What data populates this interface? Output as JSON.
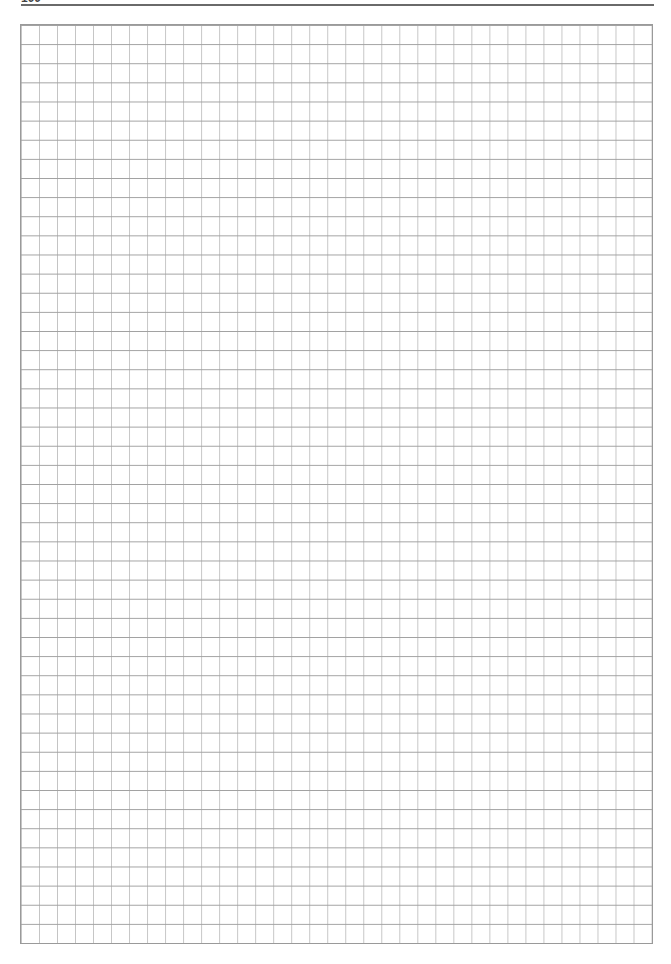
{
  "page": {
    "page_number": "100",
    "type": "graph-paper",
    "grid": {
      "columns": 35,
      "rows": 48,
      "horizontal_line_color": "#a0a0a0",
      "vertical_line_color": "#c4c4c4",
      "border_color": "#9a9a9a"
    },
    "header_rule_color": "#6a6a6a"
  }
}
